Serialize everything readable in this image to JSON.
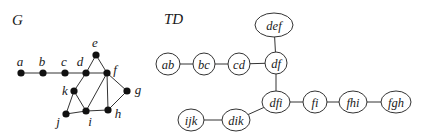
{
  "graph": {
    "title": "G",
    "vertices": [
      {
        "id": "a",
        "label": "a",
        "x": 21,
        "y": 73,
        "lx": 20,
        "ly": 66
      },
      {
        "id": "b",
        "label": "b",
        "x": 43,
        "y": 73,
        "lx": 42,
        "ly": 66
      },
      {
        "id": "c",
        "label": "c",
        "x": 65,
        "y": 73,
        "lx": 64,
        "ly": 66
      },
      {
        "id": "d",
        "label": "d",
        "x": 86,
        "y": 73,
        "lx": 80,
        "ly": 66
      },
      {
        "id": "e",
        "label": "e",
        "x": 96,
        "y": 55,
        "lx": 95,
        "ly": 47
      },
      {
        "id": "f",
        "label": "f",
        "x": 107,
        "y": 73,
        "lx": 115,
        "ly": 74
      },
      {
        "id": "g",
        "label": "g",
        "x": 127,
        "y": 91,
        "lx": 138,
        "ly": 94
      },
      {
        "id": "h",
        "label": "h",
        "x": 108,
        "y": 110,
        "lx": 118,
        "ly": 118
      },
      {
        "id": "i",
        "label": "i",
        "x": 86,
        "y": 111,
        "lx": 90,
        "ly": 126
      },
      {
        "id": "j",
        "label": "j",
        "x": 66,
        "y": 114,
        "lx": 58,
        "ly": 126
      },
      {
        "id": "k",
        "label": "k",
        "x": 74,
        "y": 91,
        "lx": 65,
        "ly": 95
      }
    ],
    "edges": [
      [
        "a",
        "b"
      ],
      [
        "b",
        "c"
      ],
      [
        "c",
        "d"
      ],
      [
        "d",
        "f"
      ],
      [
        "d",
        "e"
      ],
      [
        "e",
        "f"
      ],
      [
        "d",
        "k"
      ],
      [
        "k",
        "j"
      ],
      [
        "k",
        "i"
      ],
      [
        "j",
        "i"
      ],
      [
        "i",
        "f"
      ],
      [
        "i",
        "h"
      ],
      [
        "f",
        "h"
      ],
      [
        "f",
        "g"
      ],
      [
        "g",
        "h"
      ]
    ]
  },
  "tree_decomposition": {
    "title": "TD",
    "bags": [
      {
        "id": "ab",
        "label": "ab",
        "x": 168,
        "y": 64,
        "rx": 12,
        "ry": 11
      },
      {
        "id": "bc",
        "label": "bc",
        "x": 204,
        "y": 64,
        "rx": 11,
        "ry": 11
      },
      {
        "id": "cd",
        "label": "cd",
        "x": 239,
        "y": 64,
        "rx": 11,
        "ry": 11
      },
      {
        "id": "df",
        "label": "df",
        "x": 276,
        "y": 63,
        "rx": 11,
        "ry": 11
      },
      {
        "id": "def",
        "label": "def",
        "x": 274,
        "y": 25,
        "rx": 19,
        "ry": 12
      },
      {
        "id": "dfi",
        "label": "dfi",
        "x": 276,
        "y": 102,
        "rx": 14,
        "ry": 11
      },
      {
        "id": "fi",
        "label": "fi",
        "x": 315,
        "y": 102,
        "rx": 12,
        "ry": 11
      },
      {
        "id": "fhi",
        "label": "fhi",
        "x": 353,
        "y": 102,
        "rx": 14,
        "ry": 11
      },
      {
        "id": "fgh",
        "label": "fgh",
        "x": 396,
        "y": 102,
        "rx": 15,
        "ry": 11
      },
      {
        "id": "dik",
        "label": "dik",
        "x": 236,
        "y": 120,
        "rx": 14,
        "ry": 11
      },
      {
        "id": "ijk",
        "label": "ijk",
        "x": 191,
        "y": 120,
        "rx": 13,
        "ry": 11
      }
    ],
    "edges": [
      [
        "ab",
        "bc"
      ],
      [
        "bc",
        "cd"
      ],
      [
        "cd",
        "df"
      ],
      [
        "df",
        "def"
      ],
      [
        "df",
        "dfi"
      ],
      [
        "dfi",
        "fi"
      ],
      [
        "fi",
        "fhi"
      ],
      [
        "fhi",
        "fgh"
      ],
      [
        "dfi",
        "dik"
      ],
      [
        "dik",
        "ijk"
      ]
    ]
  },
  "labels": {
    "graph_title_pos": {
      "x": 12,
      "y": 25
    },
    "td_title_pos": {
      "x": 164,
      "y": 24
    }
  }
}
